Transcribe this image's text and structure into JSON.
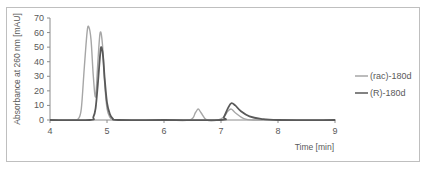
{
  "chart_data": {
    "type": "line",
    "title": "",
    "xlabel": "Time [min]",
    "ylabel": "Absorbance at 260 nm [mAU]",
    "xlim": [
      4,
      9
    ],
    "ylim": [
      0,
      70
    ],
    "x_ticks": [
      "4",
      "5",
      "6",
      "7",
      "8",
      "9"
    ],
    "y_ticks": [
      "0",
      "10",
      "20",
      "30",
      "40",
      "50",
      "60",
      "70"
    ],
    "grid": false,
    "legend_position": "right",
    "series": [
      {
        "name": "(rac)-180d",
        "color": "#a6a6a6",
        "x": [
          4.0,
          4.4,
          4.5,
          4.55,
          4.6,
          4.65,
          4.68,
          4.72,
          4.76,
          4.8,
          4.84,
          4.88,
          4.92,
          4.96,
          5.0,
          5.05,
          5.1,
          5.2,
          6.0,
          6.45,
          6.55,
          6.6,
          6.65,
          6.75,
          6.95,
          7.05,
          7.12,
          7.18,
          7.25,
          7.4,
          7.6,
          8.0,
          9.0
        ],
        "y": [
          0,
          0,
          1,
          8,
          35,
          60,
          64,
          55,
          30,
          16,
          40,
          60,
          52,
          25,
          8,
          2,
          0.5,
          0,
          0,
          0,
          5,
          7.5,
          5,
          0,
          0,
          2,
          6,
          7.5,
          5,
          1,
          0,
          0,
          0
        ]
      },
      {
        "name": "(R)-180d",
        "color": "#595959",
        "x": [
          4.0,
          4.7,
          4.76,
          4.8,
          4.84,
          4.88,
          4.9,
          4.93,
          4.96,
          5.0,
          5.05,
          5.1,
          5.2,
          6.0,
          7.0,
          7.05,
          7.12,
          7.18,
          7.25,
          7.35,
          7.5,
          7.7,
          8.0,
          9.0
        ],
        "y": [
          0,
          0,
          2,
          8,
          25,
          45,
          50,
          44,
          28,
          12,
          4,
          1,
          0,
          0,
          0,
          2,
          8,
          11.5,
          10,
          6,
          2.5,
          0.8,
          0,
          0
        ]
      }
    ]
  },
  "legend": {
    "items": [
      {
        "label": "(rac)-180d",
        "color": "#a6a6a6"
      },
      {
        "label": "(R)-180d",
        "color": "#595959"
      }
    ]
  }
}
